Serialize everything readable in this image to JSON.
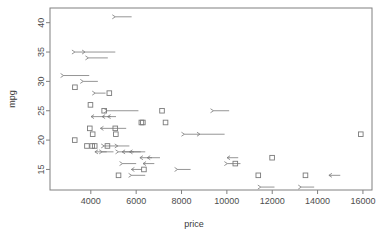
{
  "chart_data": {
    "type": "scatter",
    "title": "",
    "xlabel": "price",
    "ylabel": "mpg",
    "xlim": [
      2200,
      16400
    ],
    "ylim": [
      11.5,
      42.5
    ],
    "grid": false,
    "legend": null,
    "xticks": [
      4000,
      6000,
      8000,
      10000,
      12000,
      14000,
      16000
    ],
    "yticks": [
      15,
      20,
      25,
      30,
      35,
      40
    ],
    "xtick_labels": [
      "4000",
      "6000",
      "8000",
      "10000",
      "12000",
      "14000",
      "16000"
    ],
    "ytick_labels": [
      "15",
      "20",
      "25",
      "30",
      "35",
      "40"
    ],
    "marker": "open-square",
    "marker_color": "#7a7a7a",
    "annotation_style": "horizontal-arrow",
    "series": [
      {
        "name": "mpg vs price",
        "points": [
          {
            "price": 5079,
            "mpg": 41,
            "arrow": "left",
            "arrow_to": 5800
          },
          {
            "price": 3299,
            "mpg": 35,
            "arrow": "left",
            "arrow_to": 3720
          },
          {
            "price": 3748,
            "mpg": 35,
            "arrow": "left",
            "arrow_to": 5080
          },
          {
            "price": 3895,
            "mpg": 34,
            "arrow": "left",
            "arrow_to": 4750
          },
          {
            "price": 2800,
            "mpg": 31,
            "arrow": "left",
            "arrow_to": 3930
          },
          {
            "price": 3299,
            "mpg": 29,
            "arrow": "none"
          },
          {
            "price": 3667,
            "mpg": 30,
            "arrow": "left",
            "arrow_to": 4310
          },
          {
            "price": 4195,
            "mpg": 28,
            "arrow": "left",
            "arrow_to": 4650
          },
          {
            "price": 4816,
            "mpg": 28,
            "arrow": "none"
          },
          {
            "price": 3984,
            "mpg": 26,
            "arrow": "none"
          },
          {
            "price": 4010,
            "mpg": 24,
            "arrow": "right",
            "arrow_to": 4580
          },
          {
            "price": 4499,
            "mpg": 24,
            "arrow": "right",
            "arrow_to": 4880
          },
          {
            "price": 4589,
            "mpg": 25,
            "arrow": "none"
          },
          {
            "price": 4723,
            "mpg": 25,
            "arrow": "left",
            "arrow_to": 6100
          },
          {
            "price": 4741,
            "mpg": 24,
            "arrow": "right",
            "arrow_to": 5110
          },
          {
            "price": 7140,
            "mpg": 25,
            "arrow": "none"
          },
          {
            "price": 9410,
            "mpg": 25,
            "arrow": "left",
            "arrow_to": 10100
          },
          {
            "price": 6229,
            "mpg": 23,
            "arrow": "none"
          },
          {
            "price": 6295,
            "mpg": 23,
            "arrow": "none"
          },
          {
            "price": 7295,
            "mpg": 23,
            "arrow": "none"
          },
          {
            "price": 3955,
            "mpg": 22,
            "arrow": "none"
          },
          {
            "price": 4424,
            "mpg": 22,
            "arrow": "right",
            "arrow_to": 5560
          },
          {
            "price": 5079,
            "mpg": 22,
            "arrow": "none"
          },
          {
            "price": 4082,
            "mpg": 21,
            "arrow": "none"
          },
          {
            "price": 5104,
            "mpg": 21,
            "arrow": "none"
          },
          {
            "price": 8129,
            "mpg": 21,
            "arrow": "left",
            "arrow_to": 8800
          },
          {
            "price": 8814,
            "mpg": 21,
            "arrow": "left",
            "arrow_to": 9900
          },
          {
            "price": 15906,
            "mpg": 21,
            "arrow": "none"
          },
          {
            "price": 3291,
            "mpg": 20,
            "arrow": "none"
          },
          {
            "price": 4060,
            "mpg": 19,
            "arrow": "none"
          },
          {
            "price": 4172,
            "mpg": 19,
            "arrow": "none"
          },
          {
            "price": 3829,
            "mpg": 19,
            "arrow": "none"
          },
          {
            "price": 4589,
            "mpg": 19,
            "arrow": "left",
            "arrow_to": 5200
          },
          {
            "price": 4733,
            "mpg": 19,
            "arrow": "none"
          },
          {
            "price": 5189,
            "mpg": 19,
            "arrow": "left",
            "arrow_to": 5700
          },
          {
            "price": 4181,
            "mpg": 18,
            "arrow": "right",
            "arrow_to": 4700
          },
          {
            "price": 4504,
            "mpg": 18,
            "arrow": "left",
            "arrow_to": 5000
          },
          {
            "price": 5222,
            "mpg": 18,
            "arrow": "left",
            "arrow_to": 6400
          },
          {
            "price": 5379,
            "mpg": 18,
            "arrow": "right",
            "arrow_to": 5900
          },
          {
            "price": 5705,
            "mpg": 18,
            "arrow": "right",
            "arrow_to": 6200
          },
          {
            "price": 6165,
            "mpg": 17,
            "arrow": "right",
            "arrow_to": 6700
          },
          {
            "price": 6486,
            "mpg": 17,
            "arrow": "right",
            "arrow_to": 7050
          },
          {
            "price": 10008,
            "mpg": 17,
            "arrow": "right",
            "arrow_to": 10500
          },
          {
            "price": 11995,
            "mpg": 17,
            "arrow": "none"
          },
          {
            "price": 5399,
            "mpg": 16,
            "arrow": "left",
            "arrow_to": 6000
          },
          {
            "price": 6303,
            "mpg": 16,
            "arrow": "right",
            "arrow_to": 6800
          },
          {
            "price": 10021,
            "mpg": 16,
            "arrow": "left",
            "arrow_to": 10600
          },
          {
            "price": 10372,
            "mpg": 16,
            "arrow": "none"
          },
          {
            "price": 5788,
            "mpg": 15,
            "arrow": "right",
            "arrow_to": 6250
          },
          {
            "price": 6342,
            "mpg": 15,
            "arrow": "none"
          },
          {
            "price": 7827,
            "mpg": 15,
            "arrow": "left",
            "arrow_to": 8400
          },
          {
            "price": 5222,
            "mpg": 14,
            "arrow": "none"
          },
          {
            "price": 5798,
            "mpg": 14,
            "arrow": "left",
            "arrow_to": 6400
          },
          {
            "price": 11385,
            "mpg": 14,
            "arrow": "none"
          },
          {
            "price": 13466,
            "mpg": 14,
            "arrow": "none"
          },
          {
            "price": 14500,
            "mpg": 14,
            "arrow": "right",
            "arrow_to": 15000
          },
          {
            "price": 11497,
            "mpg": 12,
            "arrow": "left",
            "arrow_to": 12100
          },
          {
            "price": 13280,
            "mpg": 12,
            "arrow": "left",
            "arrow_to": 13850
          }
        ]
      }
    ]
  },
  "axes": {
    "x_title": "price",
    "y_title": "mpg"
  }
}
